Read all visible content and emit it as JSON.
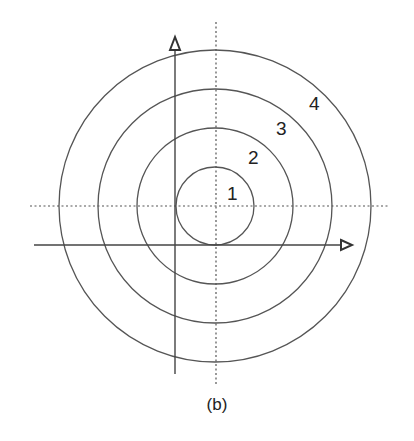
{
  "figure": {
    "caption": "(b)",
    "center": {
      "x": 215,
      "y": 206
    },
    "circles": [
      {
        "id": "1",
        "label": "1",
        "r": 39,
        "label_x": 232,
        "label_y": 200
      },
      {
        "id": "2",
        "label": "2",
        "r": 78,
        "label_x": 254,
        "label_y": 162
      },
      {
        "id": "3",
        "label": "3",
        "r": 117,
        "label_x": 283,
        "label_y": 133
      },
      {
        "id": "4",
        "label": "4",
        "r": 156,
        "label_x": 316,
        "label_y": 107
      }
    ],
    "reference_lines": {
      "horizontal_dotted": {
        "y": 206,
        "x1": 30,
        "x2": 390
      },
      "vertical_dotted": {
        "x": 216,
        "y1": 22,
        "y2": 386
      }
    },
    "axes": {
      "horizontal": {
        "y": 245,
        "x1": 34,
        "x2": 352,
        "arrow": "right"
      },
      "vertical": {
        "x": 175,
        "y1": 374,
        "y2": 40,
        "arrow": "up"
      }
    },
    "colors": {
      "stroke": "#555555",
      "background": "#ffffff"
    }
  }
}
